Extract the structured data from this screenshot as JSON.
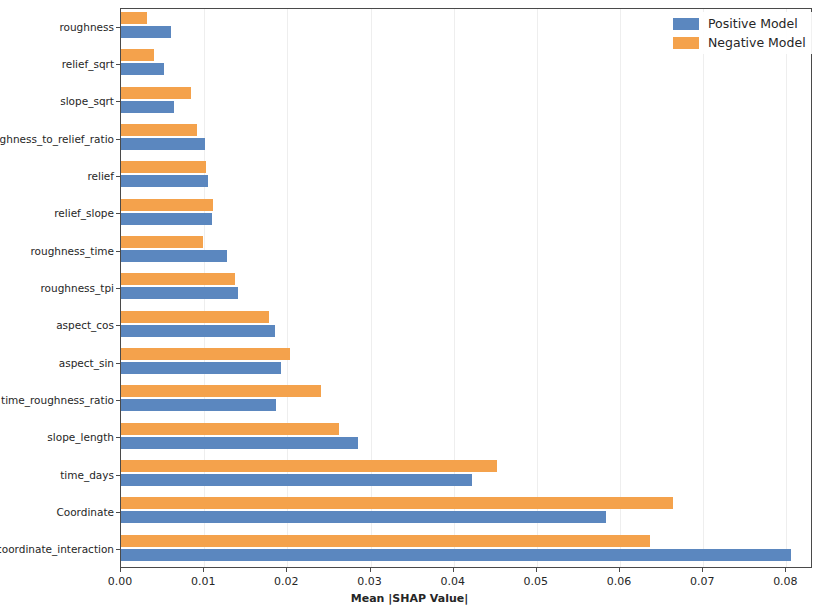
{
  "chart_data": {
    "type": "bar",
    "orientation": "horizontal",
    "title": "",
    "xlabel": "Mean |SHAP Value|",
    "ylabel": "",
    "xlim": [
      0.0,
      0.0832
    ],
    "xticks": [
      0.0,
      0.01,
      0.02,
      0.03,
      0.04,
      0.05,
      0.06,
      0.07,
      0.08
    ],
    "xtick_labels": [
      "0.00",
      "0.01",
      "0.02",
      "0.03",
      "0.04",
      "0.05",
      "0.06",
      "0.07",
      "0.08"
    ],
    "grid": true,
    "legend_position": "upper right",
    "categories": [
      "roughness",
      "relief_sqrt",
      "slope_sqrt",
      "roughness_to_relief_ratio",
      "relief",
      "relief_slope",
      "roughness_time",
      "roughness_tpi",
      "aspect_cos",
      "aspect_sin",
      "time_roughness_ratio",
      "slope_length",
      "time_days",
      "Coordinate",
      "time_coordinate_interaction"
    ],
    "series": [
      {
        "name": "Positive Model",
        "color": "#5b87bf",
        "values": [
          0.006,
          0.0052,
          0.0064,
          0.0101,
          0.0104,
          0.0109,
          0.0127,
          0.0141,
          0.0185,
          0.0192,
          0.0186,
          0.0285,
          0.0422,
          0.0583,
          0.0805
        ]
      },
      {
        "name": "Negative Model",
        "color": "#f4a24c",
        "values": [
          0.0031,
          0.004,
          0.0084,
          0.0091,
          0.0102,
          0.0111,
          0.0098,
          0.0137,
          0.0178,
          0.0203,
          0.024,
          0.0262,
          0.0452,
          0.0664,
          0.0636
        ]
      }
    ]
  },
  "legend": {
    "items": [
      {
        "label": "Positive Model",
        "color": "#5b87bf"
      },
      {
        "label": "Negative Model",
        "color": "#f4a24c"
      }
    ]
  }
}
